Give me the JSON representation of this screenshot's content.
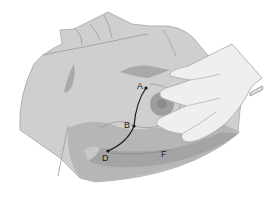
{
  "figure": {
    "colors": {
      "background": "#ffffff",
      "skin": "#cfcfcf",
      "skin_shadow": "#a9a9a9",
      "skin_deep_shadow": "#9a9a9a",
      "outline": "#8c8c8c",
      "hand": "#efefef",
      "hand_outline": "#9e9e9e",
      "path": "#1a1a1a"
    },
    "points": [
      {
        "label": "A",
        "x": 146,
        "y": 88
      },
      {
        "label": "B",
        "x": 134,
        "y": 126
      },
      {
        "label": "D",
        "x": 108,
        "y": 151
      },
      {
        "label": "F",
        "x": 165,
        "y": 154
      }
    ],
    "labels": {
      "a": "A",
      "b": "B",
      "d": "D",
      "f": "F"
    }
  }
}
